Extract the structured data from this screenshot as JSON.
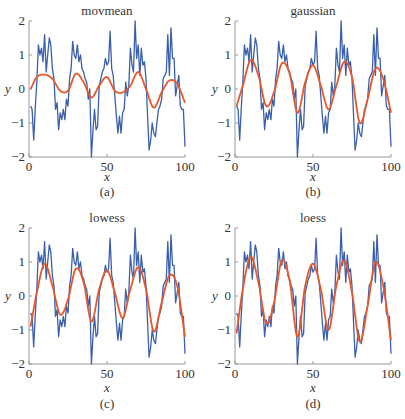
{
  "colors": {
    "data": "#3a5fad",
    "smooth": "#e8572a",
    "axis": "#999999"
  },
  "panels_layout": [
    {
      "left": 29,
      "right": 185,
      "top": 21,
      "bottom": 157
    },
    {
      "left": 235,
      "right": 391,
      "top": 21,
      "bottom": 157
    },
    {
      "left": 29,
      "right": 185,
      "top": 228,
      "bottom": 364
    },
    {
      "left": 235,
      "right": 391,
      "top": 228,
      "bottom": 364
    }
  ],
  "chart_data": [
    {
      "type": "line",
      "title": "movmean",
      "subcaption": "(a)",
      "xlabel": "x",
      "ylabel": "y",
      "xlim": [
        0,
        100
      ],
      "ylim": [
        -2,
        2
      ],
      "xticks": [
        0,
        50,
        100
      ],
      "yticks": [
        2,
        1,
        0,
        -1,
        -2
      ],
      "grid": false,
      "series": [
        {
          "name": "data",
          "ref": "noisy"
        },
        {
          "name": "movmean",
          "x": [
            1,
            5,
            10,
            15,
            20,
            25,
            30,
            35,
            40,
            45,
            50,
            55,
            60,
            65,
            70,
            75,
            80,
            85,
            90,
            95,
            100
          ],
          "values": [
            0.0,
            0.35,
            0.42,
            0.3,
            -0.05,
            -0.05,
            0.45,
            0.2,
            -0.25,
            0.1,
            0.35,
            -0.05,
            -0.1,
            0.1,
            0.5,
            0.0,
            -0.55,
            -0.1,
            0.25,
            0.15,
            -0.4
          ]
        }
      ]
    },
    {
      "type": "line",
      "title": "gaussian",
      "subcaption": "(b)",
      "xlabel": "x",
      "ylabel": "y",
      "xlim": [
        0,
        100
      ],
      "ylim": [
        -2,
        2
      ],
      "xticks": [
        0,
        50,
        100
      ],
      "yticks": [
        2,
        1,
        0,
        -1,
        -2
      ],
      "grid": false,
      "series": [
        {
          "name": "data",
          "ref": "noisy"
        },
        {
          "name": "gaussian",
          "x": [
            1,
            5,
            10,
            15,
            20,
            25,
            30,
            35,
            40,
            45,
            50,
            55,
            60,
            65,
            70,
            75,
            80,
            85,
            90,
            95,
            100
          ],
          "values": [
            -0.5,
            0.1,
            0.85,
            0.4,
            -0.5,
            -0.1,
            0.75,
            0.45,
            -0.7,
            0.2,
            0.7,
            0.1,
            -0.6,
            0.1,
            0.8,
            0.35,
            -1.0,
            -0.3,
            0.6,
            0.3,
            -0.7
          ]
        }
      ]
    },
    {
      "type": "line",
      "title": "lowess",
      "subcaption": "(c)",
      "xlabel": "x",
      "ylabel": "y",
      "xlim": [
        0,
        100
      ],
      "ylim": [
        -2,
        2
      ],
      "xticks": [
        0,
        50,
        100
      ],
      "yticks": [
        2,
        1,
        0,
        -1,
        -2
      ],
      "grid": false,
      "series": [
        {
          "name": "data",
          "ref": "noisy"
        },
        {
          "name": "lowess",
          "x": [
            1,
            5,
            10,
            15,
            20,
            25,
            30,
            35,
            40,
            45,
            50,
            55,
            60,
            65,
            70,
            75,
            80,
            85,
            90,
            95,
            100
          ],
          "values": [
            -0.9,
            0.1,
            0.95,
            0.3,
            -0.55,
            -0.1,
            0.8,
            0.4,
            -0.75,
            0.2,
            0.75,
            0.1,
            -0.65,
            0.2,
            0.85,
            0.2,
            -1.05,
            -0.2,
            0.6,
            0.3,
            -1.2
          ]
        }
      ]
    },
    {
      "type": "line",
      "title": "loess",
      "subcaption": "(d)",
      "xlabel": "x",
      "ylabel": "y",
      "xlim": [
        0,
        100
      ],
      "ylim": [
        -2,
        2
      ],
      "xticks": [
        0,
        50,
        100
      ],
      "yticks": [
        2,
        1,
        0,
        -1,
        -2
      ],
      "grid": false,
      "series": [
        {
          "name": "data",
          "ref": "noisy"
        },
        {
          "name": "loess",
          "x": [
            1,
            5,
            10,
            15,
            20,
            25,
            30,
            35,
            40,
            45,
            50,
            55,
            60,
            65,
            70,
            75,
            80,
            85,
            90,
            95,
            100
          ],
          "values": [
            -1.1,
            0.2,
            1.15,
            0.4,
            -0.8,
            -0.2,
            1.05,
            0.45,
            -1.2,
            0.3,
            0.95,
            0.2,
            -1.0,
            0.3,
            1.05,
            0.1,
            -1.35,
            -0.3,
            1.0,
            0.3,
            -1.3
          ]
        }
      ]
    }
  ],
  "noisy": {
    "x": [
      1,
      2,
      3,
      4,
      5,
      6,
      7,
      8,
      9,
      10,
      11,
      12,
      13,
      14,
      15,
      16,
      17,
      18,
      19,
      20,
      21,
      22,
      23,
      24,
      25,
      26,
      27,
      28,
      29,
      30,
      31,
      32,
      33,
      34,
      35,
      36,
      37,
      38,
      39,
      40,
      41,
      42,
      43,
      44,
      45,
      46,
      47,
      48,
      49,
      50,
      51,
      52,
      53,
      54,
      55,
      56,
      57,
      58,
      59,
      60,
      61,
      62,
      63,
      64,
      65,
      66,
      67,
      68,
      69,
      70,
      71,
      72,
      73,
      74,
      75,
      76,
      77,
      78,
      79,
      80,
      81,
      82,
      83,
      84,
      85,
      86,
      87,
      88,
      89,
      90,
      91,
      92,
      93,
      94,
      95,
      96,
      97,
      98,
      99,
      100
    ],
    "values": [
      -0.5,
      -0.6,
      -1.5,
      -0.6,
      0.2,
      1.3,
      1.0,
      1.2,
      0.8,
      1.6,
      0.5,
      1.0,
      1.5,
      1.3,
      0.6,
      0.3,
      -0.6,
      -0.4,
      -1.2,
      -0.7,
      -0.9,
      -0.6,
      -0.9,
      -0.3,
      -0.5,
      0.3,
      0.6,
      1.4,
      1.0,
      0.9,
      1.3,
      0.8,
      1.0,
      0.6,
      0.5,
      0.3,
      0.2,
      -0.3,
      0.0,
      -2.0,
      -1.2,
      -0.6,
      -1.2,
      -1.1,
      0.1,
      0.3,
      0.5,
      0.6,
      0.9,
      0.7,
      0.8,
      1.7,
      0.6,
      0.4,
      -0.2,
      -0.8,
      -1.3,
      -0.8,
      -1.3,
      -0.7,
      -0.6,
      0.2,
      -0.2,
      0.1,
      1.2,
      0.7,
      0.5,
      2.0,
      0.9,
      1.3,
      0.4,
      1.2,
      0.7,
      0.8,
      0.3,
      -0.8,
      -1.8,
      -1.5,
      -1.0,
      -1.3,
      -1.4,
      -1.0,
      -0.6,
      -0.5,
      -0.3,
      0.3,
      0.4,
      0.5,
      1.6,
      0.4,
      1.8,
      0.9,
      0.9,
      -0.2,
      0.1,
      0.4,
      -0.5,
      -0.6,
      -0.6,
      -1.7
    ]
  }
}
